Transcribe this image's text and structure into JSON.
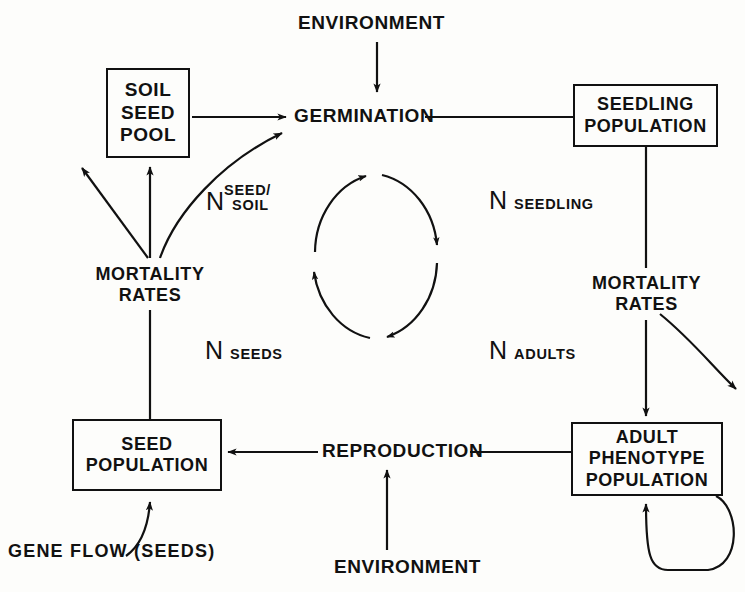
{
  "diagram": {
    "stroke_color": "#111111",
    "background_color": "#fdfdfb"
  },
  "boxes": [
    {
      "id": "soil-seed-pool",
      "lines": [
        "SOIL",
        "SEED",
        "POOL"
      ],
      "x": 106,
      "y": 68,
      "w": 84,
      "h": 90,
      "font_size": 19
    },
    {
      "id": "seedling-population",
      "lines": [
        "SEEDLING",
        "POPULATION"
      ],
      "x": 573,
      "y": 84,
      "w": 145,
      "h": 63,
      "font_size": 18
    },
    {
      "id": "seed-population",
      "lines": [
        "SEED",
        "POPULATION"
      ],
      "x": 72,
      "y": 419,
      "w": 150,
      "h": 72,
      "font_size": 18
    },
    {
      "id": "adult-phenotype-population",
      "lines": [
        "ADULT",
        "PHENOTYPE",
        "POPULATION"
      ],
      "x": 571,
      "y": 422,
      "w": 152,
      "h": 74,
      "font_size": 18
    }
  ],
  "labels": [
    {
      "id": "environment-top",
      "lines": [
        "ENVIRONMENT"
      ],
      "x": 298,
      "y": 12,
      "font_size": 19
    },
    {
      "id": "germination",
      "lines": [
        "GERMINATION"
      ],
      "x": 294,
      "y": 105,
      "font_size": 19
    },
    {
      "id": "mortality-rates-left",
      "lines": [
        "MORTALITY",
        "RATES"
      ],
      "x": 80,
      "y": 264,
      "font_size": 18
    },
    {
      "id": "mortality-rates-right",
      "lines": [
        "MORTALITY",
        "RATES"
      ],
      "x": 589,
      "y": 273,
      "font_size": 18
    },
    {
      "id": "reproduction",
      "lines": [
        "REPRODUCTION"
      ],
      "x": 322,
      "y": 440,
      "font_size": 19
    },
    {
      "id": "gene-flow-seeds",
      "lines": [
        "GENE FLOW    (SEEDS)"
      ],
      "x": 8,
      "y": 541,
      "font_size": 18
    },
    {
      "id": "environment-bottom",
      "lines": [
        "ENVIRONMENT"
      ],
      "x": 334,
      "y": 556,
      "font_size": 19
    }
  ],
  "variables": [
    {
      "id": "n-seed-soil",
      "symbol": "N",
      "subscript_lines": [
        "SEED/",
        "SOIL"
      ],
      "x": 206,
      "y": 183
    },
    {
      "id": "n-seedling",
      "symbol": "N",
      "subscript_lines": [
        "SEEDLING"
      ],
      "x": 489,
      "y": 186
    },
    {
      "id": "n-seeds",
      "symbol": "N",
      "subscript_lines": [
        "SEEDS"
      ],
      "x": 205,
      "y": 336
    },
    {
      "id": "n-adults",
      "symbol": "N",
      "subscript_lines": [
        "ADULTS"
      ],
      "x": 489,
      "y": 336
    }
  ],
  "connectors": [
    {
      "id": "environment-to-germination",
      "kind": "arrow-down"
    },
    {
      "id": "soil-seed-pool-to-germination",
      "kind": "arrow-right"
    },
    {
      "id": "germination-to-seedling-population",
      "kind": "line"
    },
    {
      "id": "mortality-left-to-soil-seed-pool",
      "kind": "arrow-up"
    },
    {
      "id": "mortality-left-upper-left-arrow",
      "kind": "arrow-up-left"
    },
    {
      "id": "mortality-left-curve-to-germination",
      "kind": "curved-arrow"
    },
    {
      "id": "mortality-left-to-seed-population",
      "kind": "line-down"
    },
    {
      "id": "seedling-population-to-mortality-right",
      "kind": "line-down"
    },
    {
      "id": "mortality-right-to-adult-population",
      "kind": "arrow-down"
    },
    {
      "id": "mortality-right-curve-out",
      "kind": "curved-arrow"
    },
    {
      "id": "adult-population-to-reproduction",
      "kind": "line"
    },
    {
      "id": "reproduction-to-seed-population",
      "kind": "arrow-left"
    },
    {
      "id": "environment-to-reproduction",
      "kind": "arrow-up"
    },
    {
      "id": "gene-flow-to-seed-population",
      "kind": "curved-arrow-up"
    },
    {
      "id": "adult-population-self-loop",
      "kind": "self-loop-arrow"
    },
    {
      "id": "central-cycle-arc-top",
      "kind": "cycle-arc"
    },
    {
      "id": "central-cycle-arc-right",
      "kind": "cycle-arc"
    },
    {
      "id": "central-cycle-arc-bottom",
      "kind": "cycle-arc"
    },
    {
      "id": "central-cycle-arc-left",
      "kind": "cycle-arc"
    }
  ]
}
